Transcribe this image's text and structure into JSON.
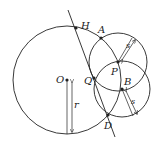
{
  "diagram": {
    "type": "geometry",
    "colors": {
      "stroke": "#222222",
      "background": "#ffffff"
    },
    "circles": [
      {
        "name": "big-circle",
        "center": "O",
        "cx": 67,
        "cy": 80,
        "r": 54
      },
      {
        "name": "circle-p",
        "center": "P",
        "cx": 118,
        "cy": 62,
        "r": 29
      },
      {
        "name": "circle-b",
        "center": "B",
        "cx": 122,
        "cy": 89,
        "r": 28
      }
    ],
    "points": [
      {
        "label": "H",
        "x": 76,
        "y": 28
      },
      {
        "label": "A",
        "x": 101,
        "y": 38
      },
      {
        "label": "P",
        "x": 118,
        "y": 62
      },
      {
        "label": "Q",
        "x": 94,
        "y": 78
      },
      {
        "label": "O",
        "x": 67,
        "y": 80
      },
      {
        "label": "B",
        "x": 122,
        "y": 89
      },
      {
        "label": "D",
        "x": 108,
        "y": 115
      }
    ],
    "labels": {
      "H": "H",
      "A": "A",
      "P": "P",
      "Q": "Q",
      "O": "O",
      "B": "B",
      "D": "D",
      "r": "r",
      "s_upper": "s",
      "s_lower": "s"
    }
  }
}
